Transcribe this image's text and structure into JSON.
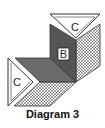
{
  "caption": "Diagram 3",
  "pieces": {
    "top_triangle": {
      "label": "C"
    },
    "left_triangle": {
      "label": "C"
    },
    "dark_piece": {
      "label": "B"
    }
  },
  "colors": {
    "dark": "#5a5a5a",
    "dark_light": "#6e6e6e",
    "stroke": "#333333",
    "white": "#ffffff"
  }
}
